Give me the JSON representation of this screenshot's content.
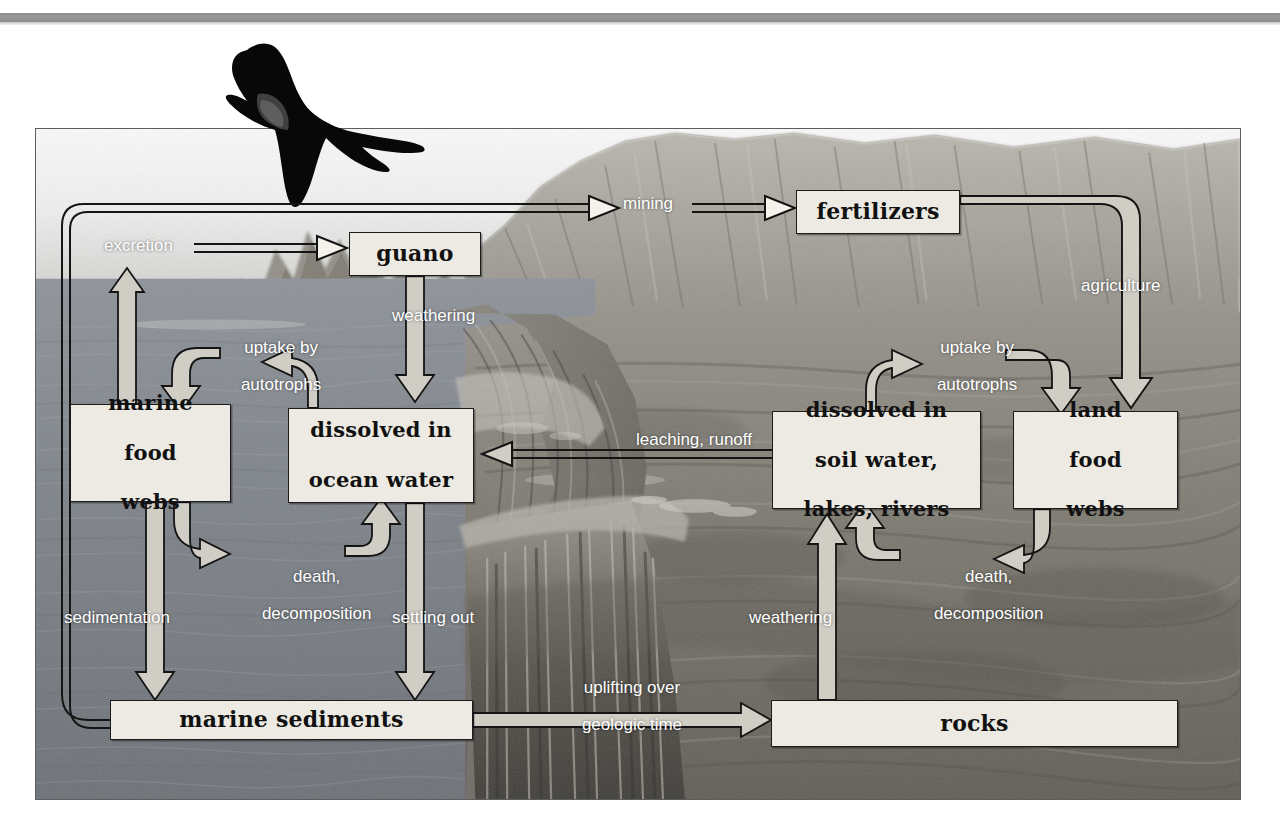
{
  "figure": {
    "frame": {
      "x": 35,
      "y": 128,
      "width": 1206,
      "height": 672
    },
    "background_scene": "coastal seascape with rocky cliffs, waterfall and ocean",
    "bird": "frigatebird-silhouette"
  },
  "colors": {
    "box_fill": "#eceae2",
    "box_border": "#1b1b1b",
    "label_text": "#ffffff",
    "arrow_light_fill": "#d7d4c8",
    "arrow_dark_fill": "#f2f0e8",
    "arrow_stroke": "#1b1b1b",
    "top_rule": "#8c8c8c",
    "ocean": "#7c8288",
    "land": "#6e6b62"
  },
  "nodes": [
    {
      "id": "guano",
      "label": "guano"
    },
    {
      "id": "fertilizers",
      "label": "fertilizers"
    },
    {
      "id": "marine-food-webs",
      "label": "marine\nfood\nwebs"
    },
    {
      "id": "dissolved-ocean",
      "label": "dissolved in\nocean water"
    },
    {
      "id": "dissolved-soil",
      "label": "dissolved in\nsoil water,\nlakes, rivers"
    },
    {
      "id": "land-food-webs",
      "label": "land\nfood\nwebs"
    },
    {
      "id": "marine-sediments",
      "label": "marine sediments"
    },
    {
      "id": "rocks",
      "label": "rocks"
    }
  ],
  "flows": [
    {
      "id": "excretion",
      "label": "excretion",
      "from": "marine-food-webs",
      "to": "guano"
    },
    {
      "id": "mining",
      "label": "mining",
      "from": "guano-loop",
      "to": "fertilizers"
    },
    {
      "id": "weathering-guano",
      "label": "weathering",
      "from": "guano",
      "to": "dissolved-ocean"
    },
    {
      "id": "agriculture",
      "label": "agriculture",
      "from": "fertilizers",
      "to": "land-food-webs"
    },
    {
      "id": "uptake-marine",
      "label": "uptake by\nautotrophs",
      "from": "dissolved-ocean",
      "to": "marine-food-webs"
    },
    {
      "id": "uptake-land",
      "label": "uptake by\nautotrophs",
      "from": "dissolved-soil",
      "to": "land-food-webs"
    },
    {
      "id": "leaching",
      "label": "leaching, runoff",
      "from": "dissolved-soil",
      "to": "dissolved-ocean"
    },
    {
      "id": "death-marine",
      "label": "death,\ndecomposition",
      "from": "marine-food-webs",
      "to": "dissolved-ocean"
    },
    {
      "id": "death-land",
      "label": "death,\ndecomposition",
      "from": "land-food-webs",
      "to": "dissolved-soil"
    },
    {
      "id": "sedimentation",
      "label": "sedimentation",
      "from": "marine-food-webs",
      "to": "marine-sediments"
    },
    {
      "id": "settling-out",
      "label": "settling out",
      "from": "dissolved-ocean",
      "to": "marine-sediments"
    },
    {
      "id": "weathering-rocks",
      "label": "weathering",
      "from": "rocks",
      "to": "dissolved-soil"
    },
    {
      "id": "uplifting",
      "label": "uplifting over\ngeologic time",
      "from": "marine-sediments",
      "to": "rocks"
    }
  ],
  "labels": {
    "excretion": "excretion",
    "mining": "mining",
    "weathering_guano": "weathering",
    "agriculture": "agriculture",
    "uptake_marine_l1": "uptake by",
    "uptake_marine_l2": "autotrophs",
    "uptake_land_l1": "uptake by",
    "uptake_land_l2": "autotrophs",
    "leaching": "leaching, runoff",
    "death_marine_l1": "death,",
    "death_marine_l2": "decomposition",
    "death_land_l1": "death,",
    "death_land_l2": "decomposition",
    "sedimentation": "sedimentation",
    "settling_out": "settling out",
    "weathering_rocks": "weathering",
    "uplifting_l1": "uplifting over",
    "uplifting_l2": "geologic time"
  },
  "node_labels": {
    "guano": "guano",
    "fertilizers": "fertilizers",
    "marine_food_webs_l1": "marine",
    "marine_food_webs_l2": "food",
    "marine_food_webs_l3": "webs",
    "dissolved_ocean_l1": "dissolved in",
    "dissolved_ocean_l2": "ocean water",
    "dissolved_soil_l1": "dissolved in",
    "dissolved_soil_l2": "soil water,",
    "dissolved_soil_l3": "lakes, rivers",
    "land_food_webs_l1": "land",
    "land_food_webs_l2": "food",
    "land_food_webs_l3": "webs",
    "marine_sediments": "marine sediments",
    "rocks": "rocks"
  }
}
